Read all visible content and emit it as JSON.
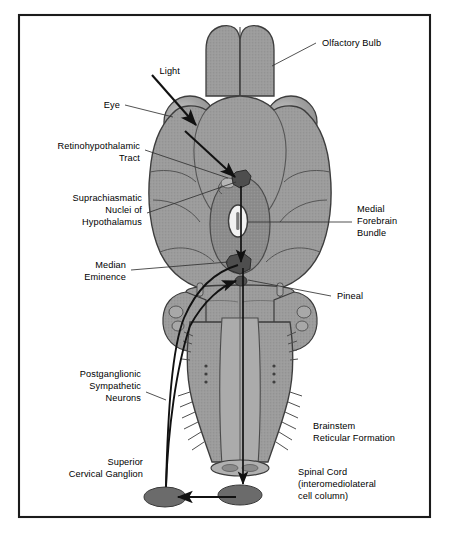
{
  "figure": {
    "frame_color": "#1a1a1a",
    "background_color": "#ffffff",
    "brain_fill": "#9a9a9a",
    "brain_outline": "#3a3a3a",
    "nucleus_fill": "#5a5a5a",
    "ganglion_fill": "#6b6b6b",
    "arrow_color": "#111111",
    "leader_color": "#333333"
  },
  "labels": {
    "olfactory_bulb": "Olfactory Bulb",
    "light": "Light",
    "eye": "Eye",
    "retinohypothalamic_tract_l1": "Retinohypothalamic",
    "retinohypothalamic_tract_l2": "Tract",
    "suprachiasmatic_l1": "Suprachiasmatic",
    "suprachiasmatic_l2": "Nuclei of",
    "suprachiasmatic_l3": "Hypothalamus",
    "median_eminence_l1": "Median",
    "median_eminence_l2": "Eminence",
    "medial_forebrain_l1": "Medial",
    "medial_forebrain_l2": "Forebrain",
    "medial_forebrain_l3": "Bundle",
    "pineal": "Pineal",
    "postganglionic_l1": "Postganglionic",
    "postganglionic_l2": "Sympathetic",
    "postganglionic_l3": "Neurons",
    "superior_cervical_l1": "Superior",
    "superior_cervical_l2": "Cervical Ganglion",
    "brainstem_l1": "Brainstem",
    "brainstem_l2": "Reticular Formation",
    "spinal_cord_l1": "Spinal Cord",
    "spinal_cord_l2": "(interomediolateral",
    "spinal_cord_l3": "cell column)"
  },
  "structures": {
    "olfactory_bulb_name": "olfactory-bulb",
    "eye_left_name": "eye-left",
    "eye_right_name": "eye-right",
    "cerebrum_name": "cerebrum",
    "third_ventricle_name": "third-ventricle",
    "scn_name": "suprachiasmatic-nucleus",
    "median_eminence_name": "median-eminence",
    "pineal_name": "pineal-gland",
    "cerebellum_name": "cerebellum",
    "brainstem_name": "brainstem",
    "spinal_cord_name": "spinal-cord",
    "ganglion_left_name": "superior-cervical-ganglion-left",
    "ganglion_right_name": "superior-cervical-ganglion-right"
  },
  "pathways": {
    "light_ray": "light-ray-arrow",
    "retinohypothalamic": "retinohypothalamic-tract-arrow",
    "scn_to_median_eminence": "scn-to-median-eminence-arrow",
    "medial_forebrain_bundle": "medial-forebrain-bundle-arrow",
    "descending_spinal": "descending-spinal-arrow",
    "postganglionic": "postganglionic-sympathetic-arrow"
  }
}
